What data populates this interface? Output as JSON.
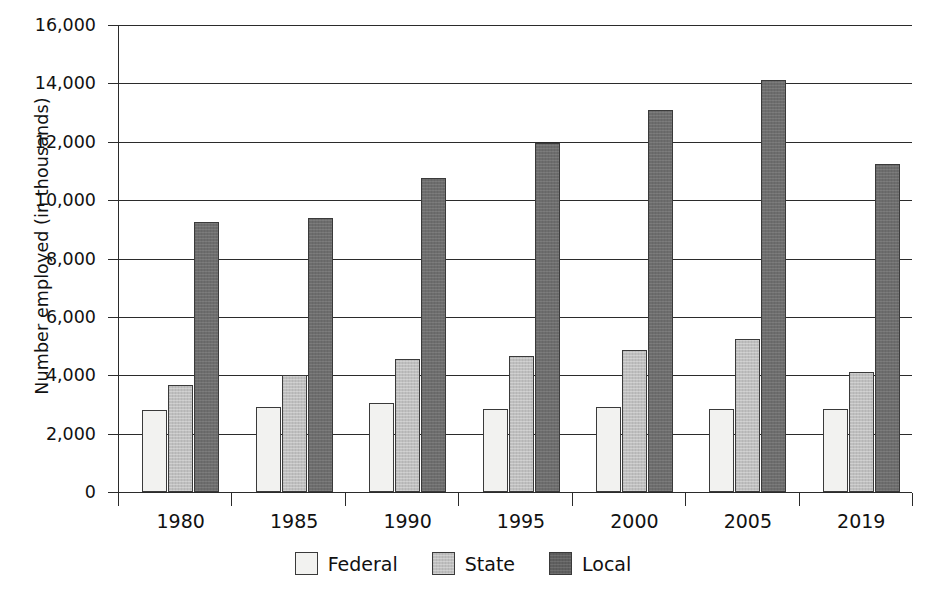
{
  "chart_data": {
    "type": "bar",
    "title": "",
    "xlabel": "",
    "ylabel": "Number employed (in thousands)",
    "categories": [
      "1980",
      "1985",
      "1990",
      "1995",
      "2000",
      "2005",
      "2019"
    ],
    "series": [
      {
        "name": "Federal",
        "color": "#f2f2f0",
        "values": [
          2800,
          2900,
          3050,
          2850,
          2900,
          2850,
          2850
        ]
      },
      {
        "name": "State",
        "color": "#bfbfbf",
        "values": [
          3650,
          4000,
          4550,
          4650,
          4850,
          5250,
          4100
        ]
      },
      {
        "name": "Local",
        "color": "#6d6d6d",
        "values": [
          9250,
          9400,
          10750,
          11950,
          13100,
          14100,
          11250
        ]
      }
    ],
    "ylim": [
      0,
      16000
    ],
    "yticks": [
      0,
      2000,
      4000,
      6000,
      8000,
      10000,
      12000,
      14000,
      16000
    ],
    "ytick_labels": [
      "0",
      "2,000",
      "4,000",
      "6,000",
      "8,000",
      "10,000",
      "12,000",
      "14,000",
      "16,000"
    ],
    "grid": true,
    "grid_axis": "y",
    "legend_position": "bottom",
    "legend_entries": [
      "Federal",
      "State",
      "Local"
    ]
  },
  "legend": {
    "items": [
      {
        "label": "Federal",
        "swatch": "federal-swatch-icon"
      },
      {
        "label": "State",
        "swatch": "state-swatch-icon"
      },
      {
        "label": "Local",
        "swatch": "local-swatch-icon"
      }
    ]
  }
}
